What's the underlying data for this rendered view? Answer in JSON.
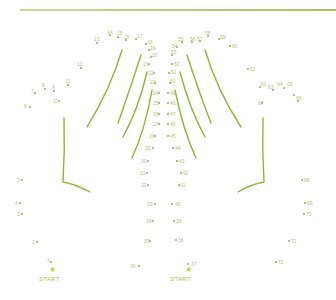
{
  "puzzle": {
    "type": "connect-the-dots",
    "accent_color": "#8db53a",
    "start_label": "START",
    "starts": [
      {
        "label": "START",
        "x": 51,
        "y": 276,
        "star_x": 49,
        "star_y": 266
      },
      {
        "label": "START",
        "x": 182,
        "y": 276,
        "star_x": 185,
        "star_y": 266
      }
    ],
    "points": [
      {
        "n": "1",
        "x": 51,
        "y": 262
      },
      {
        "n": "2",
        "x": 37,
        "y": 242
      },
      {
        "n": "3",
        "x": 22,
        "y": 214
      },
      {
        "n": "4",
        "x": 20,
        "y": 203
      },
      {
        "n": "5",
        "x": 22,
        "y": 180
      },
      {
        "n": "6",
        "x": 30,
        "y": 107
      },
      {
        "n": "7",
        "x": 35,
        "y": 93
      },
      {
        "n": "8",
        "x": 45,
        "y": 89
      },
      {
        "n": "9",
        "x": 54,
        "y": 91
      },
      {
        "n": "10",
        "x": 59,
        "y": 101
      },
      {
        "n": "11",
        "x": 68,
        "y": 85
      },
      {
        "n": "12",
        "x": 81,
        "y": 68
      },
      {
        "n": "13",
        "x": 97,
        "y": 43
      },
      {
        "n": "14",
        "x": 110,
        "y": 35
      },
      {
        "n": "15",
        "x": 118,
        "y": 37
      },
      {
        "n": "16",
        "x": 126,
        "y": 40
      },
      {
        "n": "17",
        "x": 136,
        "y": 39
      },
      {
        "n": "18",
        "x": 146,
        "y": 44
      },
      {
        "n": "19",
        "x": 149,
        "y": 50
      },
      {
        "n": "20",
        "x": 151,
        "y": 57
      },
      {
        "n": "21",
        "x": 149,
        "y": 64
      },
      {
        "n": "22",
        "x": 154,
        "y": 73
      },
      {
        "n": "23",
        "x": 155,
        "y": 83
      },
      {
        "n": "24",
        "x": 159,
        "y": 93
      },
      {
        "n": "25",
        "x": 159,
        "y": 103
      },
      {
        "n": "26",
        "x": 159,
        "y": 114
      },
      {
        "n": "27",
        "x": 159,
        "y": 124
      },
      {
        "n": "28",
        "x": 155,
        "y": 136
      },
      {
        "n": "29",
        "x": 153,
        "y": 148
      },
      {
        "n": "30",
        "x": 148,
        "y": 161
      },
      {
        "n": "31",
        "x": 147,
        "y": 173
      },
      {
        "n": "32",
        "x": 148,
        "y": 185
      },
      {
        "n": "33",
        "x": 155,
        "y": 204
      },
      {
        "n": "34",
        "x": 153,
        "y": 221
      },
      {
        "n": "35",
        "x": 150,
        "y": 241
      },
      {
        "n": "36",
        "x": 139,
        "y": 266
      },
      {
        "n": "37",
        "x": 188,
        "y": 264
      },
      {
        "n": "38",
        "x": 176,
        "y": 240
      },
      {
        "n": "39",
        "x": 174,
        "y": 221
      },
      {
        "n": "40",
        "x": 172,
        "y": 204
      },
      {
        "n": "41",
        "x": 179,
        "y": 185
      },
      {
        "n": "42",
        "x": 181,
        "y": 173
      },
      {
        "n": "43",
        "x": 177,
        "y": 161
      },
      {
        "n": "44",
        "x": 173,
        "y": 148
      },
      {
        "n": "45",
        "x": 168,
        "y": 136
      },
      {
        "n": "46",
        "x": 168,
        "y": 124
      },
      {
        "n": "47",
        "x": 168,
        "y": 114
      },
      {
        "n": "48",
        "x": 168,
        "y": 103
      },
      {
        "n": "49",
        "x": 168,
        "y": 93
      },
      {
        "n": "50",
        "x": 170,
        "y": 83
      },
      {
        "n": "51",
        "x": 169,
        "y": 73
      },
      {
        "n": "52",
        "x": 172,
        "y": 64
      },
      {
        "n": "53",
        "x": 172,
        "y": 55
      },
      {
        "n": "54",
        "x": 177,
        "y": 47
      },
      {
        "n": "55",
        "x": 182,
        "y": 42
      },
      {
        "n": "56",
        "x": 192,
        "y": 42
      },
      {
        "n": "57",
        "x": 200,
        "y": 41
      },
      {
        "n": "58",
        "x": 208,
        "y": 36
      },
      {
        "n": "59",
        "x": 219,
        "y": 39
      },
      {
        "n": "60",
        "x": 230,
        "y": 46
      },
      {
        "n": "61",
        "x": 248,
        "y": 69
      },
      {
        "n": "62",
        "x": 260,
        "y": 87
      },
      {
        "n": "63",
        "x": 273,
        "y": 90
      },
      {
        "n": "64",
        "x": 284,
        "y": 88
      },
      {
        "n": "65",
        "x": 294,
        "y": 95
      },
      {
        "n": "66",
        "x": 298,
        "y": 101
      },
      {
        "n": "67",
        "x": 262,
        "y": 103
      },
      {
        "n": "68",
        "x": 302,
        "y": 180
      },
      {
        "n": "69",
        "x": 305,
        "y": 203
      },
      {
        "n": "70",
        "x": 304,
        "y": 214
      },
      {
        "n": "71",
        "x": 289,
        "y": 241
      },
      {
        "n": "72",
        "x": 276,
        "y": 262
      }
    ],
    "label_points": [
      {
        "n": "6",
        "lx": 24,
        "ly": 104
      },
      {
        "n": "7",
        "lx": 31,
        "ly": 89
      },
      {
        "n": "8",
        "lx": 42,
        "ly": 83
      },
      {
        "n": "9",
        "lx": 52,
        "ly": 85
      },
      {
        "n": "10",
        "lx": 53,
        "ly": 99
      },
      {
        "n": "11",
        "lx": 65,
        "ly": 79
      },
      {
        "n": "12",
        "lx": 77,
        "ly": 62
      },
      {
        "n": "13",
        "lx": 94,
        "ly": 37
      },
      {
        "n": "14",
        "lx": 107,
        "ly": 30
      },
      {
        "n": "15",
        "lx": 117,
        "ly": 31
      },
      {
        "n": "16",
        "lx": 124,
        "ly": 35
      },
      {
        "n": "17",
        "lx": 137,
        "ly": 34
      },
      {
        "n": "18",
        "lx": 147,
        "ly": 40
      },
      {
        "n": "19",
        "lx": 150,
        "ly": 46
      },
      {
        "n": "20",
        "lx": 152,
        "ly": 53
      },
      {
        "n": "21",
        "lx": 143,
        "ly": 62
      },
      {
        "n": "22",
        "lx": 148,
        "ly": 71
      },
      {
        "n": "23",
        "lx": 150,
        "ly": 80
      },
      {
        "n": "24",
        "lx": 153,
        "ly": 91
      },
      {
        "n": "25",
        "lx": 153,
        "ly": 101
      },
      {
        "n": "26",
        "lx": 153,
        "ly": 112
      },
      {
        "n": "27",
        "lx": 153,
        "ly": 122
      },
      {
        "n": "28",
        "lx": 149,
        "ly": 134
      },
      {
        "n": "29",
        "lx": 145,
        "ly": 146
      },
      {
        "n": "30",
        "lx": 141,
        "ly": 159
      },
      {
        "n": "31",
        "lx": 140,
        "ly": 171
      },
      {
        "n": "32",
        "lx": 141,
        "ly": 183
      },
      {
        "n": "33",
        "lx": 147,
        "ly": 202
      },
      {
        "n": "34",
        "lx": 146,
        "ly": 219
      },
      {
        "n": "35",
        "lx": 144,
        "ly": 239
      },
      {
        "n": "36",
        "lx": 130,
        "ly": 264
      },
      {
        "n": "37",
        "lx": 191,
        "ly": 262
      },
      {
        "n": "38",
        "lx": 178,
        "ly": 238
      },
      {
        "n": "39",
        "lx": 176,
        "ly": 219
      },
      {
        "n": "40",
        "lx": 175,
        "ly": 202
      },
      {
        "n": "41",
        "lx": 180,
        "ly": 183
      },
      {
        "n": "42",
        "lx": 183,
        "ly": 171
      },
      {
        "n": "43",
        "lx": 179,
        "ly": 159
      },
      {
        "n": "44",
        "lx": 175,
        "ly": 146
      },
      {
        "n": "45",
        "lx": 170,
        "ly": 134
      },
      {
        "n": "46",
        "lx": 170,
        "ly": 122
      },
      {
        "n": "47",
        "lx": 170,
        "ly": 112
      },
      {
        "n": "48",
        "lx": 170,
        "ly": 101
      },
      {
        "n": "49",
        "lx": 170,
        "ly": 91
      },
      {
        "n": "50",
        "lx": 170,
        "ly": 79
      },
      {
        "n": "51",
        "lx": 171,
        "ly": 70
      },
      {
        "n": "52",
        "lx": 174,
        "ly": 62
      },
      {
        "n": "53",
        "lx": 171,
        "ly": 50
      },
      {
        "n": "54",
        "lx": 172,
        "ly": 44
      },
      {
        "n": "55",
        "lx": 178,
        "ly": 37
      },
      {
        "n": "56",
        "lx": 190,
        "ly": 37
      },
      {
        "n": "57",
        "lx": 197,
        "ly": 37
      },
      {
        "n": "58",
        "lx": 205,
        "ly": 31
      },
      {
        "n": "59",
        "lx": 220,
        "ly": 35
      },
      {
        "n": "60",
        "lx": 232,
        "ly": 44
      },
      {
        "n": "61",
        "lx": 250,
        "ly": 67
      },
      {
        "n": "62",
        "lx": 261,
        "ly": 82
      },
      {
        "n": "63",
        "lx": 268,
        "ly": 85
      },
      {
        "n": "64",
        "lx": 277,
        "ly": 82
      },
      {
        "n": "65",
        "lx": 287,
        "ly": 82
      },
      {
        "n": "66",
        "lx": 296,
        "ly": 96
      },
      {
        "n": "67",
        "lx": 258,
        "ly": 101
      },
      {
        "n": "68",
        "lx": 304,
        "ly": 178
      },
      {
        "n": "69",
        "lx": 307,
        "ly": 201
      },
      {
        "n": "70",
        "lx": 306,
        "ly": 212
      },
      {
        "n": "71",
        "lx": 291,
        "ly": 239
      },
      {
        "n": "72",
        "lx": 278,
        "ly": 260
      },
      {
        "n": "1",
        "lx": 47,
        "ly": 258
      },
      {
        "n": "2",
        "lx": 32,
        "ly": 240
      },
      {
        "n": "3",
        "lx": 17,
        "ly": 212
      },
      {
        "n": "4",
        "lx": 15,
        "ly": 201
      },
      {
        "n": "5",
        "lx": 17,
        "ly": 178
      }
    ]
  }
}
